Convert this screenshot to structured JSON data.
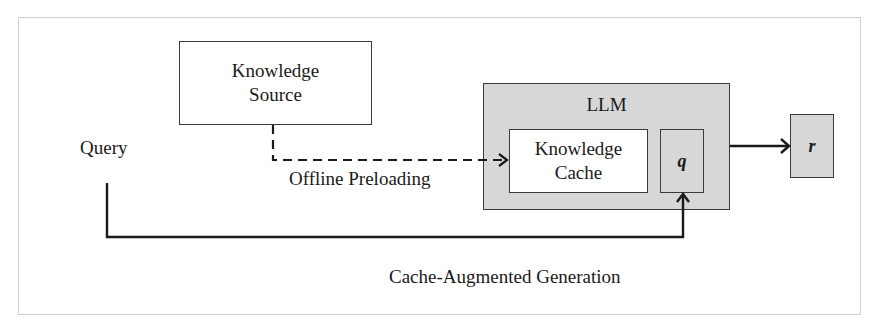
{
  "diagram": {
    "nodes": {
      "knowledge_source": {
        "line1": "Knowledge",
        "line2": "Source"
      },
      "llm": {
        "label": "LLM"
      },
      "knowledge_cache": {
        "line1": "Knowledge",
        "line2": "Cache"
      },
      "query_token": {
        "label": "q"
      },
      "response": {
        "label": "r"
      }
    },
    "labels": {
      "query": "Query",
      "offline_preloading": "Offline Preloading",
      "caption": "Cache-Augmented Generation"
    },
    "edges": [
      {
        "from": "knowledge_source",
        "to": "knowledge_cache",
        "style": "dashed",
        "label": "Offline Preloading"
      },
      {
        "from": "query",
        "to": "query_token",
        "style": "solid"
      },
      {
        "from": "llm",
        "to": "response",
        "style": "solid"
      }
    ],
    "colors": {
      "box_fill_gray": "#d7d7d7",
      "box_fill_white": "#ffffff",
      "stroke": "#1a1a1a",
      "frame_border": "#cfcfcf"
    }
  }
}
